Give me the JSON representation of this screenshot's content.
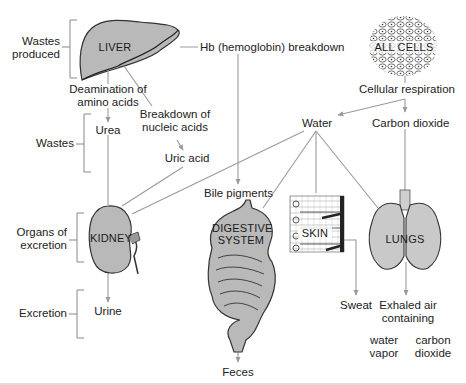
{
  "brackets": {
    "wastes_produced": "Wastes\nproduced",
    "wastes": "Wastes",
    "organs_of_excretion": "Organs of\nexcretion",
    "excretion": "Excretion"
  },
  "sources": {
    "liver": "LIVER",
    "all_cells": "ALL CELLS",
    "hb_breakdown": "Hb (hemoglobin) breakdown",
    "deamination": "Deamination of\namino acids",
    "nucleic_breakdown": "Breakdown of\nnucleic acids",
    "cellular_respiration": "Cellular respiration"
  },
  "wastes": {
    "urea": "Urea",
    "uric_acid": "Uric acid",
    "water": "Water",
    "carbon_dioxide": "Carbon dioxide",
    "bile_pigments": "Bile pigments"
  },
  "organs": {
    "kidney": "KIDNEY",
    "digestive_line1": "DIGESTIVE",
    "digestive_line2": "SYSTEM",
    "skin": "SKIN",
    "lungs": "LUNGS"
  },
  "products": {
    "urine": "Urine",
    "feces": "Feces",
    "sweat": "Sweat",
    "exhaled_air": "Exhaled air\ncontaining",
    "water_vapor": "water\nvapor",
    "carbon_dioxide": "carbon\ndioxide"
  },
  "colors": {
    "organ_fill": "#b9b9b9",
    "arrow": "#9a9a9a",
    "outline": "#333333",
    "text": "#222222"
  }
}
